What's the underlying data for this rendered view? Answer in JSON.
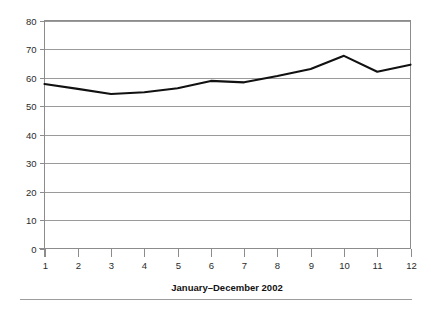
{
  "chart_data": {
    "type": "line",
    "title": "",
    "subtitle": "",
    "xlabel": "January–December 2002",
    "ylabel": "",
    "x": [
      1,
      2,
      3,
      4,
      5,
      6,
      7,
      8,
      9,
      10,
      11,
      12
    ],
    "xtick_labels": [
      "1",
      "2",
      "3",
      "4",
      "5",
      "6",
      "7",
      "8",
      "9",
      "10",
      "11",
      "12"
    ],
    "ytick_labels": [
      "0",
      "10",
      "20",
      "30",
      "40",
      "50",
      "60",
      "70",
      "80"
    ],
    "yticks": [
      0,
      10,
      20,
      30,
      40,
      50,
      60,
      70,
      80
    ],
    "ylim": [
      0,
      80
    ],
    "xlim": [
      1,
      12
    ],
    "grid": "horizontal",
    "legend": "none",
    "series": [
      {
        "name": "",
        "values": [
          57.7,
          56.0,
          54.2,
          54.8,
          56.2,
          58.8,
          58.3,
          60.5,
          63.0,
          67.6,
          62.0,
          64.5
        ]
      }
    ],
    "colors": {
      "line": "#111111",
      "grid": "#9a9a9a",
      "axis": "#8c8c8c",
      "text": "#2b2b2b",
      "background": "#ffffff"
    }
  }
}
